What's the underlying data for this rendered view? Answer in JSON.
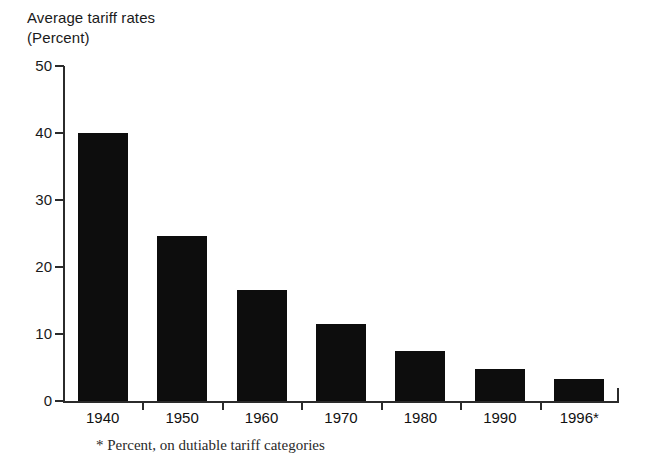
{
  "chart_data": {
    "type": "bar",
    "title": "Average tariff rates",
    "subtitle": "(Percent)",
    "xlabel": "",
    "ylabel": "",
    "categories": [
      "1940",
      "1950",
      "1960",
      "1970",
      "1980",
      "1990",
      "1996*"
    ],
    "values": [
      40.0,
      24.7,
      16.5,
      11.5,
      7.5,
      4.8,
      3.3
    ],
    "ylim": [
      0,
      50
    ],
    "yticks": [
      0,
      10,
      20,
      30,
      40,
      50
    ],
    "ytick_labels": [
      "0",
      "10",
      "20",
      "30",
      "40",
      "50"
    ],
    "grid": false,
    "legend": false,
    "bar_color": "#0d0d0d",
    "axis_color": "#2b2b2b",
    "background_color": "#ffffff",
    "footnote": "* Percent, on dutiable tariff categories",
    "footnote_clipped": true
  },
  "title": {
    "line1": "Average tariff rates",
    "line2": "(Percent)"
  }
}
